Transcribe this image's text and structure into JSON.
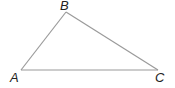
{
  "diagram": {
    "type": "triangle",
    "stroke_color": "#9a9a9a",
    "label_color": "#222222",
    "vertices": [
      {
        "name": "A",
        "x": 21,
        "y": 70,
        "label_x": 10,
        "label_y": 82
      },
      {
        "name": "B",
        "x": 66,
        "y": 12,
        "label_x": 60,
        "label_y": 10
      },
      {
        "name": "C",
        "x": 158,
        "y": 70,
        "label_x": 155,
        "label_y": 82
      }
    ],
    "edges": [
      {
        "from": "A",
        "to": "B"
      },
      {
        "from": "B",
        "to": "C"
      },
      {
        "from": "A",
        "to": "C"
      }
    ]
  }
}
